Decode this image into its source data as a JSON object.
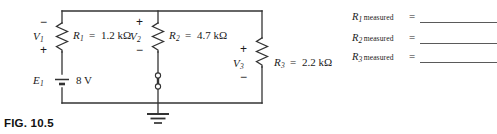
{
  "figure": {
    "caption": "FIG. 10.5"
  },
  "circuit": {
    "source": {
      "designator": "E",
      "designator_sub": "1",
      "value": "8 V",
      "symbol": "battery"
    },
    "branches": [
      {
        "voltage_label": "V",
        "voltage_sub": "1",
        "polarity_top": "−",
        "polarity_bottom": "+",
        "resistor_label": "R",
        "resistor_sub": "1",
        "equals": "=",
        "resistance": "1.2 kΩ"
      },
      {
        "voltage_label": "V",
        "voltage_sub": "2",
        "polarity_top": "+",
        "polarity_bottom": "−",
        "resistor_label": "R",
        "resistor_sub": "2",
        "equals": "=",
        "resistance": "4.7 kΩ"
      },
      {
        "voltage_label": "V",
        "voltage_sub": "3",
        "polarity_top": "+",
        "polarity_bottom": "−",
        "resistor_label": "R",
        "resistor_sub": "3",
        "equals": "=",
        "resistance": "2.2 kΩ"
      }
    ],
    "ground": {
      "name": "earth-ground"
    },
    "test_terminals": {
      "name": "break-terminals",
      "count": 2
    }
  },
  "measurements": {
    "equals": "=",
    "word": "measured",
    "rows": [
      {
        "symbol": "R",
        "index": "1",
        "value": ""
      },
      {
        "symbol": "R",
        "index": "2",
        "value": ""
      },
      {
        "symbol": "R",
        "index": "3",
        "value": ""
      }
    ]
  },
  "colors": {
    "ink": "#1a1a1a",
    "wire": "#333333",
    "blank_line": "#5a5a5a",
    "background": "#ffffff"
  }
}
